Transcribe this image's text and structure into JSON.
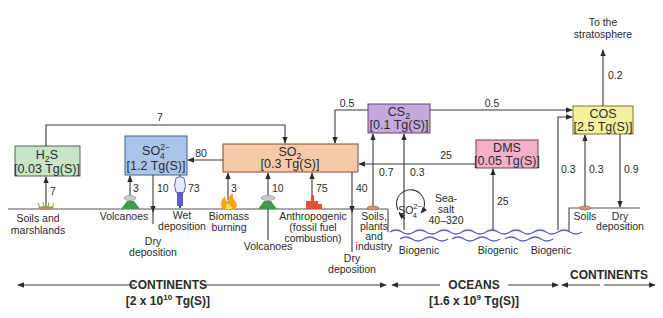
{
  "boxes": {
    "h2s": {
      "name": "H2S",
      "value": "[0.03 Tg(S)]",
      "color": "#c9e4c6"
    },
    "so4": {
      "name": "SO4 2-",
      "value": "[1.2 Tg(S)]",
      "color": "#a9c6ea"
    },
    "so2": {
      "name": "SO2",
      "value": "[0.3 Tg(S)]",
      "color": "#f6c9a8"
    },
    "cs2": {
      "name": "CS2",
      "value": "[0.1 Tg(S)]",
      "color": "#c5a8dc"
    },
    "dms": {
      "name": "DMS",
      "value": "[0.05 Tg(S)]",
      "color": "#f1b1c9"
    },
    "cos": {
      "name": "COS",
      "value": "[2.5 Tg(S)]",
      "color": "#f6ef9e"
    }
  },
  "fluxes": {
    "h2s_to_so2": "7",
    "soils_to_h2s": "7",
    "so2_to_so4": "80",
    "volcanoes_to_so4": "3",
    "so4_dry_dep": "10",
    "so4_wet_dep": "73",
    "biomass_to_so2": "3",
    "volcanoes_to_so2": "10",
    "anthro_to_so2": "75",
    "so2_dry_dep": "40",
    "cs2_to_so2": "0.5",
    "cs2_to_cos": "0.5",
    "soils_plants_to_cs2": "0.7",
    "biogenic_to_cs2": "0.3",
    "dms_to_so2": "25",
    "biogenic_to_dms": "25",
    "ocean_to_cos": "0.3",
    "soils_to_cos": "0.3",
    "cos_dry_dep": "0.9",
    "cos_to_strat": "0.2",
    "seasalt_range": "40–320"
  },
  "labels": {
    "soils_marsh_1": "Soils and",
    "soils_marsh_2": "marshlands",
    "volcanoes_1": "Volcanoes",
    "wet_dep_1": "Wet",
    "wet_dep_2": "deposition",
    "dry_dep_a1": "Dry",
    "dry_dep_a2": "deposition",
    "biomass_1": "Biomass",
    "biomass_2": "burning",
    "volcanoes_2": "Volcanoes",
    "anthro_1": "Anthropogenic",
    "anthro_2": "(fossil fuel",
    "anthro_3": "combustion)",
    "dry_dep_b1": "Dry",
    "dry_dep_b2": "deposition",
    "soils_plants_1": "Soils,",
    "soils_plants_2": "plants",
    "soils_plants_3": "and",
    "soils_plants_4": "industry",
    "biogenic_1": "Biogenic",
    "biogenic_2": "Biogenic",
    "biogenic_3": "Biogenic",
    "seasalt_1": "Sea-",
    "seasalt_2": "salt",
    "ocean_so4": "SO4 2-",
    "soils_cos": "Soils",
    "dry_dep_c1": "Dry",
    "dry_dep_c2": "deposition",
    "strat_1": "To the",
    "strat_2": "stratosphere"
  },
  "regions": {
    "continents_left": {
      "name": "CONTINENTS",
      "mass_prefix": "[2 x 10",
      "mass_exp": "10",
      "mass_suffix": " Tg(S)]"
    },
    "oceans": {
      "name": "OCEANS",
      "mass_prefix": "[1.6 x 10",
      "mass_exp": "9",
      "mass_suffix": " Tg(S)]"
    },
    "continents_right": {
      "name": "CONTINENTS"
    }
  }
}
